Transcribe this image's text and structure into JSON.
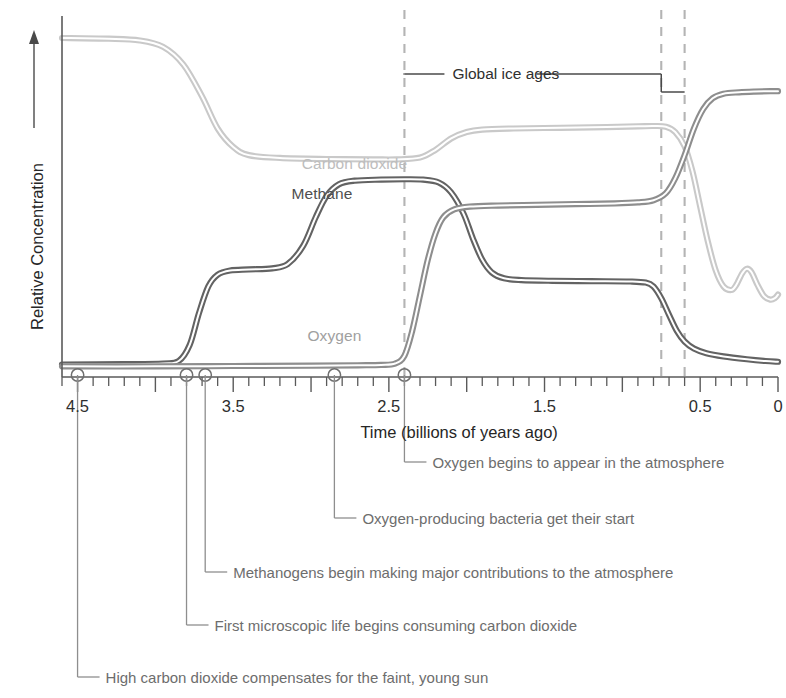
{
  "chart_data": {
    "type": "line",
    "title": "",
    "xlabel": "Time (billions of years ago)",
    "ylabel": "Relative Concentration",
    "xlim": [
      4.6,
      0
    ],
    "ylim": [
      0,
      1
    ],
    "x_reversed": true,
    "grid": false,
    "legend_position": "inline-curve-labels",
    "xticks_major": [
      "4.5",
      "3.5",
      "2.5",
      "1.5",
      "0.5",
      "0"
    ],
    "xtick_major_values": [
      4.5,
      3.5,
      2.5,
      1.5,
      0.5,
      0
    ],
    "xtick_minor_step": 0.1,
    "yticks": [],
    "series": [
      {
        "name": "Carbon dioxide",
        "color": "#c9c9c9",
        "label_x": 2.72,
        "label_y": 0.6,
        "points": [
          [
            4.6,
            0.955
          ],
          [
            4.3,
            0.953
          ],
          [
            4.1,
            0.948
          ],
          [
            3.95,
            0.93
          ],
          [
            3.82,
            0.88
          ],
          [
            3.7,
            0.79
          ],
          [
            3.6,
            0.7
          ],
          [
            3.5,
            0.648
          ],
          [
            3.4,
            0.625
          ],
          [
            3.2,
            0.617
          ],
          [
            2.9,
            0.614
          ],
          [
            2.6,
            0.613
          ],
          [
            2.45,
            0.613
          ],
          [
            2.3,
            0.618
          ],
          [
            2.2,
            0.64
          ],
          [
            2.1,
            0.672
          ],
          [
            2.0,
            0.69
          ],
          [
            1.9,
            0.697
          ],
          [
            1.7,
            0.7
          ],
          [
            1.4,
            0.702
          ],
          [
            1.1,
            0.704
          ],
          [
            0.9,
            0.706
          ],
          [
            0.8,
            0.707
          ],
          [
            0.72,
            0.705
          ],
          [
            0.66,
            0.69
          ],
          [
            0.6,
            0.65
          ],
          [
            0.55,
            0.58
          ],
          [
            0.5,
            0.48
          ],
          [
            0.45,
            0.38
          ],
          [
            0.4,
            0.3
          ],
          [
            0.35,
            0.255
          ],
          [
            0.3,
            0.245
          ],
          [
            0.27,
            0.258
          ],
          [
            0.23,
            0.292
          ],
          [
            0.2,
            0.305
          ],
          [
            0.17,
            0.295
          ],
          [
            0.13,
            0.258
          ],
          [
            0.09,
            0.228
          ],
          [
            0.05,
            0.218
          ],
          [
            0.02,
            0.222
          ],
          [
            0.0,
            0.232
          ]
        ]
      },
      {
        "name": "Methane",
        "color": "#636363",
        "label_x": 2.93,
        "label_y": 0.515,
        "points": [
          [
            4.6,
            0.035
          ],
          [
            4.2,
            0.036
          ],
          [
            3.95,
            0.038
          ],
          [
            3.85,
            0.045
          ],
          [
            3.78,
            0.09
          ],
          [
            3.72,
            0.18
          ],
          [
            3.66,
            0.255
          ],
          [
            3.6,
            0.288
          ],
          [
            3.52,
            0.3
          ],
          [
            3.4,
            0.303
          ],
          [
            3.25,
            0.306
          ],
          [
            3.15,
            0.318
          ],
          [
            3.05,
            0.37
          ],
          [
            2.97,
            0.45
          ],
          [
            2.9,
            0.51
          ],
          [
            2.82,
            0.543
          ],
          [
            2.72,
            0.553
          ],
          [
            2.55,
            0.556
          ],
          [
            2.4,
            0.557
          ],
          [
            2.28,
            0.556
          ],
          [
            2.18,
            0.548
          ],
          [
            2.1,
            0.52
          ],
          [
            2.02,
            0.46
          ],
          [
            1.96,
            0.39
          ],
          [
            1.9,
            0.33
          ],
          [
            1.84,
            0.295
          ],
          [
            1.76,
            0.278
          ],
          [
            1.65,
            0.273
          ],
          [
            1.45,
            0.271
          ],
          [
            1.2,
            0.27
          ],
          [
            0.95,
            0.269
          ],
          [
            0.85,
            0.266
          ],
          [
            0.8,
            0.255
          ],
          [
            0.75,
            0.222
          ],
          [
            0.7,
            0.175
          ],
          [
            0.65,
            0.13
          ],
          [
            0.6,
            0.1
          ],
          [
            0.54,
            0.08
          ],
          [
            0.46,
            0.067
          ],
          [
            0.35,
            0.058
          ],
          [
            0.2,
            0.05
          ],
          [
            0.08,
            0.045
          ],
          [
            0.0,
            0.043
          ]
        ]
      },
      {
        "name": "Oxygen",
        "color": "#8e8e8e",
        "label_x": 2.85,
        "label_y": 0.115,
        "points": [
          [
            4.6,
            0.03
          ],
          [
            4.0,
            0.03
          ],
          [
            3.5,
            0.031
          ],
          [
            3.0,
            0.032
          ],
          [
            2.7,
            0.033
          ],
          [
            2.55,
            0.034
          ],
          [
            2.46,
            0.038
          ],
          [
            2.4,
            0.06
          ],
          [
            2.35,
            0.13
          ],
          [
            2.3,
            0.23
          ],
          [
            2.25,
            0.33
          ],
          [
            2.2,
            0.405
          ],
          [
            2.15,
            0.45
          ],
          [
            2.08,
            0.472
          ],
          [
            1.98,
            0.48
          ],
          [
            1.8,
            0.483
          ],
          [
            1.55,
            0.485
          ],
          [
            1.3,
            0.487
          ],
          [
            1.05,
            0.489
          ],
          [
            0.9,
            0.492
          ],
          [
            0.8,
            0.498
          ],
          [
            0.72,
            0.518
          ],
          [
            0.66,
            0.56
          ],
          [
            0.6,
            0.625
          ],
          [
            0.54,
            0.7
          ],
          [
            0.48,
            0.755
          ],
          [
            0.42,
            0.785
          ],
          [
            0.35,
            0.798
          ],
          [
            0.25,
            0.802
          ],
          [
            0.15,
            0.804
          ],
          [
            0.05,
            0.805
          ],
          [
            0.0,
            0.805
          ]
        ]
      }
    ],
    "vertical_markers": [
      {
        "value": 2.4,
        "style": "dashed"
      },
      {
        "value": 0.75,
        "style": "dashed"
      },
      {
        "value": 0.6,
        "style": "dashed"
      }
    ],
    "annotations": [
      {
        "label": "Global ice ages",
        "type": "bracket",
        "spans": [
          2.4,
          0.75,
          0.6
        ]
      },
      {
        "label": "Oxygen begins to appear in the atmosphere",
        "marker_value": 2.4
      },
      {
        "label": "Oxygen-producing bacteria get their start",
        "marker_value": 2.85
      },
      {
        "label": "Methanogens begin making major contributions to the atmosphere",
        "marker_value": 3.68
      },
      {
        "label": "First microscopic life begins consuming carbon dioxide",
        "marker_value": 3.8
      },
      {
        "label": "High carbon dioxide compensates for the faint, young sun",
        "marker_value": 4.5
      }
    ]
  },
  "colors": {
    "carbon_dioxide": "#c9c9c9",
    "methane": "#636363",
    "oxygen": "#8e8e8e",
    "axis": "#5a5a5a",
    "dashed_marker": "#b4b4b4",
    "annotation_text": "#6d6d6d",
    "bracket": "#4a4a4a"
  },
  "axis": {
    "x_title": "Time (billions of years ago)",
    "y_title": "Relative Concentration",
    "x_labels": [
      "4.5",
      "3.5",
      "2.5",
      "1.5",
      "0.5",
      "0"
    ]
  },
  "series_labels": {
    "co2": "Carbon dioxide",
    "ch4": "Methane",
    "o2": "Oxygen"
  },
  "ice_ages": {
    "label": "Global ice ages"
  },
  "annotations_text": {
    "a1": "Oxygen begins to appear in the atmosphere",
    "a2": "Oxygen-producing bacteria get their start",
    "a3": "Methanogens begin making major contributions to the atmosphere",
    "a4": "First microscopic life begins consuming carbon dioxide",
    "a5": "High carbon dioxide compensates for the faint, young sun"
  }
}
